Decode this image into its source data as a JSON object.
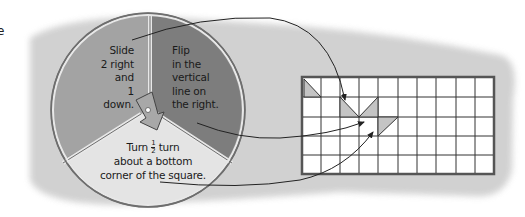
{
  "edge_fragment": "e",
  "spinner": {
    "sections": [
      {
        "id": "slide",
        "lines": [
          "Slide",
          "2 right",
          "and",
          "1 down."
        ],
        "color": "#a3a3a3"
      },
      {
        "id": "flip",
        "lines": [
          "Flip",
          "in the",
          "vertical",
          "line on",
          "the right."
        ],
        "color": "#7d7d7d"
      },
      {
        "id": "turn",
        "line1_prefix": "Turn",
        "fraction_num": "1",
        "fraction_den": "2",
        "line1_suffix": "turn",
        "lines": [
          "about a bottom",
          "corner of the square."
        ],
        "color": "#e4e4e4"
      }
    ],
    "pointer": "arrow-pointing-down-into-turn-section"
  },
  "grid": {
    "columns": 10,
    "rows": 5,
    "shaded_shapes": 3
  },
  "colors": {
    "backdrop": "#cfcfcf",
    "rim": "#6e6e6e",
    "line": "#222222",
    "shape": "#c4c4c4"
  }
}
